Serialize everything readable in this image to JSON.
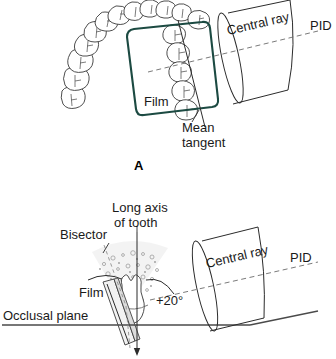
{
  "figure": {
    "panels": [
      {
        "id": "A",
        "panel_letter": "A",
        "view": "occlusal-view",
        "labels": {
          "film": "Film",
          "mean_tangent_line1": "Mean",
          "mean_tangent_line2": "tangent",
          "central_ray": "Central ray",
          "pid": "PID"
        }
      },
      {
        "id": "B",
        "view": "lateral-cross-section",
        "labels": {
          "bisector": "Bisector",
          "long_axis_line1": "Long axis",
          "long_axis_line2": "of tooth",
          "film": "Film",
          "occlusal_plane": "Occlusal plane",
          "angle": "+20°",
          "central_ray": "Central ray",
          "pid": "PID"
        }
      }
    ]
  },
  "colors": {
    "film_outline": "#1c4a42",
    "line": "#2b2b2b",
    "dashed": "#6b6b6b",
    "fan_fill": "#e9e9e9",
    "text": "#1a1a1a",
    "background": "#ffffff"
  },
  "icons": {
    "tooth": "tooth-icon",
    "pid_cone": "pid-cylinder-icon",
    "film_packet": "film-packet-icon"
  }
}
